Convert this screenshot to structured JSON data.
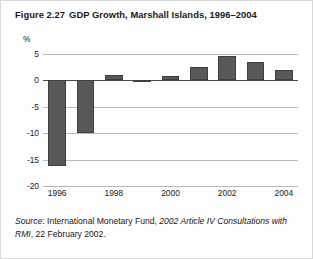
{
  "figure": {
    "number": "Figure 2.27",
    "title": "GDP Growth, Marshall Islands, 1996–2004"
  },
  "source": {
    "label": "Source",
    "separator": ": ",
    "publisher": "International Monetary Fund, ",
    "document": "2002 Article IV Consultations with RMI",
    "date": ", 22 February 2002."
  },
  "colors": {
    "bar_fill": "#58585a",
    "bar_stroke": "#3f3f41",
    "gridline": "#b9b9b9",
    "zero_line": "#4a4a4a",
    "text": "#1a1a1a",
    "background": "#fdfdfd",
    "frame": "#d8d8d8"
  },
  "chart_data": {
    "type": "bar",
    "title": "GDP Growth, Marshall Islands, 1996–2004",
    "xlabel": "",
    "ylabel": "%",
    "yunit": "%",
    "categories": [
      "1996",
      "1997",
      "1998",
      "1999",
      "2000",
      "2001",
      "2002",
      "2003",
      "2004"
    ],
    "values": [
      -16.3,
      -10.0,
      1.1,
      0.1,
      0.8,
      2.6,
      4.6,
      3.4,
      2.0
    ],
    "xtick_labels": [
      "1996",
      "1998",
      "2000",
      "2002",
      "2004"
    ],
    "xtick_categories": [
      "1996",
      "1998",
      "2000",
      "2002",
      "2004"
    ],
    "ytick_labels": [
      "5",
      "0",
      "-5",
      "-10",
      "-15",
      "-20"
    ],
    "ytick_values": [
      5,
      0,
      -5,
      -10,
      -15,
      -20
    ],
    "ylim": [
      -20,
      5
    ],
    "grid": true,
    "legend": false
  }
}
